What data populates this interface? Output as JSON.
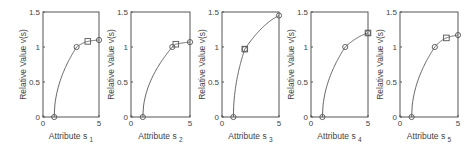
{
  "chart_data": [
    {
      "type": "line",
      "title": "",
      "xlabel": "Attribute s",
      "xlabel_sub": "1",
      "ylabel": "Relative Value v(s)",
      "xlim": [
        0,
        5
      ],
      "ylim": [
        0,
        1.5
      ],
      "xticks": [
        "0",
        "5"
      ],
      "yticks": [
        "0",
        "0.5",
        "1",
        "1.5"
      ],
      "points": [
        {
          "x": 1,
          "y": 0,
          "marker": "circle"
        },
        {
          "x": 3,
          "y": 1.0,
          "marker": "circle"
        },
        {
          "x": 4,
          "y": 1.08,
          "marker": "square"
        },
        {
          "x": 5,
          "y": 1.1,
          "marker": "circle"
        }
      ]
    },
    {
      "type": "line",
      "title": "",
      "xlabel": "Attribute s",
      "xlabel_sub": "2",
      "ylabel": "Relative Value v(s)",
      "xlim": [
        0,
        5
      ],
      "ylim": [
        0,
        1.5
      ],
      "xticks": [
        "0",
        "5"
      ],
      "yticks": [
        "0",
        "0.5",
        "1",
        "1.5"
      ],
      "points": [
        {
          "x": 1,
          "y": 0,
          "marker": "circle"
        },
        {
          "x": 3.5,
          "y": 1.0,
          "marker": "circle"
        },
        {
          "x": 3.8,
          "y": 1.04,
          "marker": "square"
        },
        {
          "x": 5,
          "y": 1.07,
          "marker": "circle"
        }
      ]
    },
    {
      "type": "line",
      "title": "",
      "xlabel": "Attribute s",
      "xlabel_sub": "3",
      "ylabel": "Relative Value v(s)",
      "xlim": [
        0,
        5
      ],
      "ylim": [
        0,
        1.5
      ],
      "xticks": [
        "0",
        "5"
      ],
      "yticks": [
        "0",
        "0.5",
        "1",
        "1.5"
      ],
      "points": [
        {
          "x": 1,
          "y": 0,
          "marker": "circle"
        },
        {
          "x": 2,
          "y": 0.97,
          "marker": "circle+square"
        },
        {
          "x": 5,
          "y": 1.45,
          "marker": "circle"
        }
      ]
    },
    {
      "type": "line",
      "title": "",
      "xlabel": "Attribute s",
      "xlabel_sub": "4",
      "ylabel": "Relative Value v(s)",
      "xlim": [
        0,
        5
      ],
      "ylim": [
        0,
        1.5
      ],
      "xticks": [
        "0",
        "5"
      ],
      "yticks": [
        "0",
        "0.5",
        "1",
        "1.5"
      ],
      "points": [
        {
          "x": 1,
          "y": 0,
          "marker": "circle"
        },
        {
          "x": 3,
          "y": 1.0,
          "marker": "circle"
        },
        {
          "x": 5,
          "y": 1.2,
          "marker": "circle+square"
        }
      ]
    },
    {
      "type": "line",
      "title": "",
      "xlabel": "Attribute s",
      "xlabel_sub": "5",
      "ylabel": "Relative Value v(s)",
      "xlim": [
        0,
        5
      ],
      "ylim": [
        0,
        1.5
      ],
      "xticks": [
        "0",
        "5"
      ],
      "yticks": [
        "0",
        "0.5",
        "1",
        "1.5"
      ],
      "points": [
        {
          "x": 1,
          "y": 0,
          "marker": "circle"
        },
        {
          "x": 3,
          "y": 1.0,
          "marker": "circle"
        },
        {
          "x": 4,
          "y": 1.13,
          "marker": "square"
        },
        {
          "x": 5,
          "y": 1.17,
          "marker": "circle"
        }
      ]
    }
  ],
  "layout": {
    "boxes": [
      [
        43,
        12,
        99,
        117
      ],
      [
        131,
        12,
        190,
        117
      ],
      [
        222,
        12,
        279,
        117
      ],
      [
        311,
        12,
        368,
        117
      ],
      [
        400,
        12,
        458,
        117
      ]
    ],
    "color": "#555555"
  }
}
